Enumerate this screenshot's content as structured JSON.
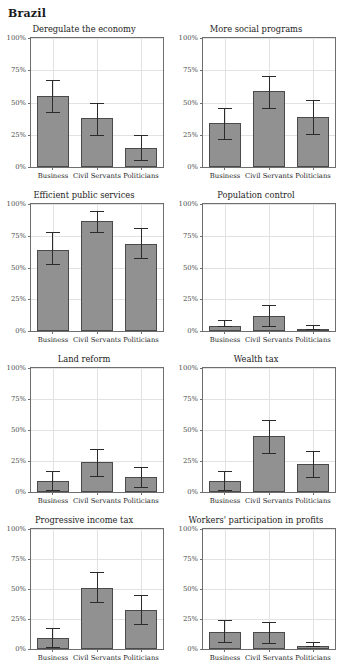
{
  "figure": {
    "title": "Brazil",
    "y_tick_labels": [
      "100%",
      "75%",
      "50%",
      "25%",
      "0%"
    ],
    "y_tick_values": [
      100,
      75,
      50,
      25,
      0
    ],
    "categories": [
      "Business",
      "Civil Servants",
      "Politicians"
    ],
    "bar_color": "#919191",
    "bar_edge_color": "#4a4a4a",
    "error_color": "#2b2b2b",
    "grid_color": "#e2e2e2",
    "axis_color": "#6e6e6e"
  },
  "chart_data": [
    {
      "type": "bar",
      "title": "Deregulate the economy",
      "categories": [
        "Business",
        "Civil Servants",
        "Politicians"
      ],
      "values": [
        54,
        37,
        14
      ],
      "err_low": [
        42,
        24,
        5
      ],
      "err_high": [
        67,
        49,
        24
      ],
      "xlabel": "",
      "ylabel": "",
      "ylim": [
        0,
        100
      ],
      "grid": true,
      "legend": "none"
    },
    {
      "type": "bar",
      "title": "More social programs",
      "categories": [
        "Business",
        "Civil Servants",
        "Politicians"
      ],
      "values": [
        33,
        58,
        38
      ],
      "err_low": [
        21,
        45,
        25
      ],
      "err_high": [
        45,
        70,
        51
      ],
      "xlabel": "",
      "ylabel": "",
      "ylim": [
        0,
        100
      ],
      "grid": true,
      "legend": "none"
    },
    {
      "type": "bar",
      "title": "Efficient public services",
      "categories": [
        "Business",
        "Civil Servants",
        "Politicians"
      ],
      "values": [
        63,
        86,
        68
      ],
      "err_low": [
        52,
        77,
        57
      ],
      "err_high": [
        77,
        94,
        80
      ],
      "xlabel": "",
      "ylabel": "",
      "ylim": [
        0,
        100
      ],
      "grid": true,
      "legend": "none"
    },
    {
      "type": "bar",
      "title": "Population control",
      "categories": [
        "Business",
        "Civil Servants",
        "Politicians"
      ],
      "values": [
        3,
        11,
        1
      ],
      "err_low": [
        3,
        3,
        1
      ],
      "err_high": [
        8,
        20,
        4
      ],
      "xlabel": "",
      "ylabel": "",
      "ylim": [
        0,
        100
      ],
      "grid": true,
      "legend": "none"
    },
    {
      "type": "bar",
      "title": "Land reform",
      "categories": [
        "Business",
        "Civil Servants",
        "Politicians"
      ],
      "values": [
        8,
        23,
        11
      ],
      "err_low": [
        1,
        12,
        3
      ],
      "err_high": [
        16,
        34,
        19
      ],
      "xlabel": "",
      "ylabel": "",
      "ylim": [
        0,
        100
      ],
      "grid": true,
      "legend": "none"
    },
    {
      "type": "bar",
      "title": "Wealth tax",
      "categories": [
        "Business",
        "Civil Servants",
        "Politicians"
      ],
      "values": [
        8,
        44,
        22
      ],
      "err_low": [
        1,
        31,
        11
      ],
      "err_high": [
        16,
        57,
        32
      ],
      "xlabel": "",
      "ylabel": "",
      "ylim": [
        0,
        100
      ],
      "grid": true,
      "legend": "none"
    },
    {
      "type": "bar",
      "title": "Progressive income tax",
      "categories": [
        "Business",
        "Civil Servants",
        "Politicians"
      ],
      "values": [
        8,
        50,
        32
      ],
      "err_low": [
        1,
        38,
        20
      ],
      "err_high": [
        17,
        63,
        44
      ],
      "xlabel": "",
      "ylabel": "",
      "ylim": [
        0,
        100
      ],
      "grid": true,
      "legend": "none"
    },
    {
      "type": "bar",
      "title": "Workers' participation in profits",
      "categories": [
        "Business",
        "Civil Servants",
        "Politicians"
      ],
      "values": [
        13,
        13,
        2
      ],
      "err_low": [
        5,
        4,
        2
      ],
      "err_high": [
        23,
        22,
        5
      ],
      "xlabel": "",
      "ylabel": "",
      "ylim": [
        0,
        100
      ],
      "grid": true,
      "legend": "none"
    }
  ]
}
